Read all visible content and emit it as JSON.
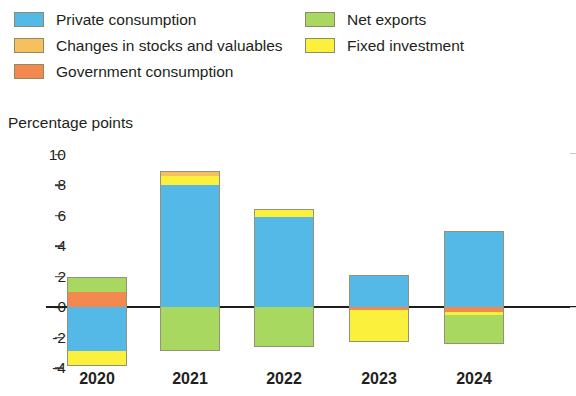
{
  "legend": {
    "left_column": [
      {
        "label": "Private consumption",
        "color": "#55b9e8",
        "key": "private_consumption"
      },
      {
        "label": "Changes in stocks and valuables",
        "color": "#f7c05e",
        "key": "changes_in_stocks"
      },
      {
        "label": "Government consumption",
        "color": "#f4894f",
        "key": "government_consumption"
      }
    ],
    "right_column": [
      {
        "label": "Net exports",
        "color": "#a8d860",
        "key": "net_exports"
      },
      {
        "label": "Fixed investment",
        "color": "#fbf03c",
        "key": "fixed_investment"
      }
    ]
  },
  "axis_title": "Percentage points",
  "chart_data": {
    "type": "bar",
    "title": "",
    "subtitle": "",
    "xlabel": "",
    "ylabel": "Percentage points",
    "ylim": [
      -4,
      10
    ],
    "yticks": [
      10,
      8,
      6,
      4,
      2,
      0,
      -2,
      -4
    ],
    "ytick_labels": [
      "10",
      "8",
      "6",
      "4",
      "2",
      "0",
      "-2",
      "-4"
    ],
    "grid": false,
    "stacked": true,
    "legend_position": "top",
    "categories": [
      "2020",
      "2021",
      "2022",
      "2023",
      "2024"
    ],
    "series": [
      {
        "name": "Private consumption",
        "color": "#55b9e8",
        "values": [
          -2.9,
          8.0,
          5.9,
          2.1,
          5.0
        ]
      },
      {
        "name": "Changes in stocks and valuables",
        "color": "#f7c05e",
        "values": [
          0.0,
          0.3,
          0.0,
          0.0,
          0.0
        ]
      },
      {
        "name": "Government consumption",
        "color": "#f4894f",
        "values": [
          1.0,
          0.0,
          0.0,
          -0.2,
          -0.3
        ]
      },
      {
        "name": "Net exports",
        "color": "#a8d860",
        "values": [
          1.0,
          -2.9,
          -2.6,
          0.0,
          -1.9
        ]
      },
      {
        "name": "Fixed investment",
        "color": "#fbf03c",
        "values": [
          -1.0,
          0.6,
          0.5,
          -2.1,
          -0.2
        ]
      }
    ],
    "stack_order_positive": [
      "Private consumption",
      "Fixed investment",
      "Changes in stocks and valuables",
      "Government consumption",
      "Net exports"
    ],
    "stack_order_negative": [
      "Government consumption",
      "Fixed investment",
      "Private consumption",
      "Net exports"
    ],
    "bars": [
      {
        "category": "2020",
        "positive": [
          {
            "name": "Government consumption",
            "value": 1.0
          },
          {
            "name": "Net exports",
            "value": 1.0
          }
        ],
        "negative": [
          {
            "name": "Private consumption",
            "value": -2.9
          },
          {
            "name": "Fixed investment",
            "value": -1.0
          }
        ],
        "net": -1.9
      },
      {
        "category": "2021",
        "positive": [
          {
            "name": "Private consumption",
            "value": 8.0
          },
          {
            "name": "Fixed investment",
            "value": 0.6
          },
          {
            "name": "Changes in stocks and valuables",
            "value": 0.3
          }
        ],
        "negative": [
          {
            "name": "Net exports",
            "value": -2.9
          }
        ],
        "net": 6.0
      },
      {
        "category": "2022",
        "positive": [
          {
            "name": "Private consumption",
            "value": 5.9
          },
          {
            "name": "Fixed investment",
            "value": 0.5
          }
        ],
        "negative": [
          {
            "name": "Net exports",
            "value": -2.6
          }
        ],
        "net": 3.8
      },
      {
        "category": "2023",
        "positive": [
          {
            "name": "Private consumption",
            "value": 2.1
          }
        ],
        "negative": [
          {
            "name": "Government consumption",
            "value": -0.2
          },
          {
            "name": "Fixed investment",
            "value": -2.1
          }
        ],
        "net": -0.2
      },
      {
        "category": "2024",
        "positive": [
          {
            "name": "Private consumption",
            "value": 5.0
          }
        ],
        "negative": [
          {
            "name": "Government consumption",
            "value": -0.3
          },
          {
            "name": "Fixed investment",
            "value": -0.2
          },
          {
            "name": "Net exports",
            "value": -1.9
          }
        ],
        "net": 2.6
      }
    ]
  }
}
